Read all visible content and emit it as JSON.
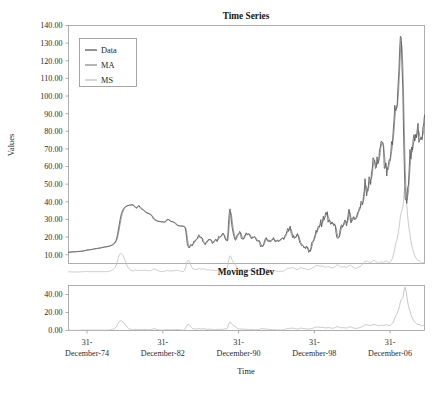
{
  "figure": {
    "axis_label_x": "Time",
    "axis_label_y": "Values"
  },
  "panels": {
    "top": {
      "title": "Time Series",
      "yticks": [
        "10.00",
        "20.00",
        "30.00",
        "40.00",
        "50.00",
        "60.00",
        "70.00",
        "80.00",
        "90.00",
        "100.00",
        "110.00",
        "120.00",
        "130.00",
        "140.00"
      ],
      "legend": [
        {
          "label": "Data",
          "color": "#585858"
        },
        {
          "label": "MA",
          "color": "#8c8c8c"
        },
        {
          "label": "MS",
          "color": "#c2c2c2"
        }
      ]
    },
    "bottom": {
      "title": "Moving StDev",
      "yticks": [
        "0.00",
        "20.00",
        "40.00"
      ]
    },
    "xticks": [
      "31-\nDecember-74",
      "31-\nDecember-82",
      "31-\nDecember-90",
      "31-\nDecember-98",
      "31-\nDecember-06"
    ],
    "xticks_line1": [
      "31-",
      "31-",
      "31-",
      "31-",
      "31-"
    ],
    "xticks_line2": [
      "December-74",
      "December-82",
      "December-90",
      "December-98",
      "December-06"
    ]
  },
  "chart_data": {
    "type": "line",
    "title": "Time Series",
    "xlabel": "Time",
    "ylabel": "Values",
    "grid": false,
    "legend_position": "top-left",
    "subplots": [
      {
        "name": "Time Series",
        "ylim": [
          5,
          140
        ],
        "yticks": [
          10,
          20,
          30,
          40,
          50,
          60,
          70,
          80,
          90,
          100,
          110,
          120,
          130,
          140
        ],
        "series": [
          {
            "name": "Data",
            "color": "#585858"
          },
          {
            "name": "MA",
            "color": "#8c8c8c"
          },
          {
            "name": "MS",
            "color": "#c2c2c2"
          }
        ]
      },
      {
        "name": "Moving StDev",
        "ylim": [
          0,
          50
        ],
        "yticks": [
          0,
          20,
          40
        ],
        "series": [
          {
            "name": "MS",
            "color": "#bdbdbd"
          }
        ]
      }
    ],
    "x_tick_labels": [
      "31-December-74",
      "31-December-82",
      "31-December-90",
      "31-December-98",
      "31-December-06"
    ],
    "x_tick_values": [
      1974.96,
      1982.96,
      1990.96,
      1998.96,
      2006.96
    ],
    "x_range": [
      1973.0,
      2010.6
    ],
    "x_step_years": 0.0833,
    "values_data": [
      11.4,
      11.4,
      11.5,
      11.5,
      11.6,
      11.6,
      11.6,
      11.6,
      11.7,
      11.7,
      11.7,
      11.8,
      11.8,
      11.8,
      11.9,
      11.9,
      12.0,
      12.0,
      12.1,
      12.2,
      12.3,
      12.4,
      12.5,
      12.6,
      12.7,
      12.7,
      12.8,
      12.9,
      12.9,
      13.0,
      13.1,
      13.2,
      13.3,
      13.4,
      13.4,
      13.5,
      13.6,
      13.6,
      13.7,
      13.8,
      13.9,
      14.0,
      14.1,
      14.2,
      14.3,
      14.4,
      14.4,
      14.5,
      14.6,
      14.7,
      14.8,
      14.9,
      15.1,
      15.3,
      15.5,
      15.8,
      16.1,
      16.6,
      17.2,
      18.0,
      19.4,
      21.5,
      24.0,
      26.8,
      29.5,
      31.8,
      33.5,
      34.8,
      35.7,
      36.4,
      36.9,
      37.3,
      37.6,
      37.8,
      37.9,
      38.0,
      38.1,
      38.2,
      38.3,
      38.3,
      38.2,
      37.9,
      37.4,
      36.8,
      36.3,
      36.6,
      37.4,
      37.9,
      37.6,
      36.8,
      36.2,
      35.9,
      35.7,
      35.4,
      34.9,
      34.4,
      34.0,
      33.8,
      33.6,
      33.4,
      33.2,
      33.0,
      32.7,
      32.3,
      31.8,
      30.9,
      30.2,
      29.8,
      29.6,
      29.4,
      29.2,
      29.0,
      28.9,
      28.8,
      28.8,
      28.7,
      28.6,
      28.6,
      28.5,
      28.4,
      28.6,
      29.0,
      29.6,
      30.1,
      30.0,
      29.7,
      29.2,
      28.9,
      28.8,
      28.7,
      28.6,
      28.3,
      28.0,
      27.6,
      27.2,
      26.8,
      26.5,
      26.4,
      26.4,
      26.3,
      26.2,
      26.2,
      26.2,
      26.1,
      25.9,
      25.3,
      23.4,
      19.1,
      15.4,
      14.5,
      13.8,
      14.7,
      15.8,
      15.5,
      15.1,
      16.3,
      17.7,
      17.5,
      18.3,
      18.6,
      19.2,
      20.2,
      21.3,
      20.3,
      19.5,
      19.9,
      19.5,
      17.6,
      16.9,
      16.4,
      15.6,
      16.8,
      17.6,
      17.6,
      18.6,
      18.7,
      18.4,
      18.5,
      17.7,
      16.3,
      17.1,
      17.4,
      18.2,
      18.8,
      18.3,
      17.4,
      19.1,
      20.4,
      19.9,
      20.1,
      20.7,
      21.6,
      22.3,
      21.5,
      20.4,
      18.9,
      18.2,
      17.7,
      18.2,
      27.3,
      33.5,
      36.0,
      32.3,
      27.3,
      24.5,
      22.0,
      20.4,
      18.6,
      18.2,
      19.9,
      21.4,
      21.7,
      21.9,
      23.2,
      22.5,
      19.5,
      18.8,
      19.0,
      18.9,
      20.8,
      20.9,
      22.4,
      21.7,
      21.3,
      21.9,
      21.7,
      20.3,
      19.4,
      19.1,
      20.1,
      19.8,
      20.3,
      19.9,
      19.1,
      17.9,
      18.0,
      17.5,
      18.1,
      16.9,
      14.4,
      15.0,
      14.8,
      14.7,
      16.4,
      17.9,
      19.1,
      19.7,
      18.4,
      17.5,
      17.7,
      18.1,
      17.2,
      18.1,
      18.6,
      18.5,
      19.7,
      18.4,
      17.4,
      17.3,
      18.0,
      18.4,
      17.4,
      17.8,
      18.2,
      18.9,
      19.1,
      19.4,
      19.5,
      18.6,
      20.4,
      21.3,
      22.0,
      23.8,
      24.9,
      23.2,
      25.2,
      26.2,
      22.2,
      21.3,
      19.6,
      20.9,
      19.2,
      19.7,
      19.9,
      21.3,
      22.0,
      20.2,
      18.3,
      16.7,
      16.1,
      15.1,
      15.4,
      15.0,
      13.8,
      14.1,
      13.4,
      14.9,
      14.4,
      13.0,
      11.3,
      12.5,
      12.0,
      14.7,
      17.3,
      17.7,
      17.9,
      20.1,
      21.3,
      23.8,
      22.7,
      25.0,
      26.1,
      25.6,
      27.3,
      29.9,
      25.7,
      28.8,
      31.8,
      29.8,
      31.2,
      33.9,
      33.0,
      34.4,
      28.4,
      29.6,
      29.6,
      27.3,
      27.4,
      28.6,
      27.6,
      26.5,
      27.5,
      26.2,
      22.2,
      19.6,
      19.4,
      19.7,
      20.7,
      24.0,
      26.3,
      27.0,
      25.5,
      26.9,
      28.4,
      29.7,
      28.8,
      26.3,
      29.4,
      32.9,
      35.8,
      33.5,
      28.2,
      28.2,
      30.7,
      30.8,
      31.6,
      29.7,
      30.3,
      31.1,
      32.5,
      34.3,
      34.7,
      36.7,
      36.7,
      40.3,
      39.8,
      38.3,
      43.0,
      45.9,
      53.1,
      48.5,
      43.3,
      46.8,
      48.2,
      54.2,
      53.0,
      49.8,
      56.4,
      59.0,
      65.0,
      64.0,
      62.4,
      58.9,
      59.4,
      65.5,
      61.6,
      62.9,
      69.7,
      70.9,
      74.4,
      74.1,
      73.0,
      70.8,
      58.9,
      59.3,
      62.0,
      54.6,
      59.3,
      60.6,
      63.9,
      63.5,
      67.5,
      74.2,
      72.4,
      79.9,
      85.8,
      94.8,
      91.7,
      92.9,
      95.4,
      105.5,
      112.6,
      125.4,
      133.9,
      133.4,
      116.7,
      104.1,
      76.6,
      57.4,
      41.4,
      41.7,
      39.1,
      48.0,
      49.6,
      59.2,
      69.7,
      64.2,
      71.1,
      69.4,
      75.8,
      78.1,
      74.5,
      78.3,
      76.4,
      81.2,
      84.5,
      73.7,
      75.3,
      76.3,
      76.6,
      75.2,
      81.9,
      84.1,
      89.2
    ],
    "values_ms": [
      0.3,
      0.3,
      0.3,
      0.3,
      0.2,
      0.2,
      0.2,
      0.2,
      0.2,
      0.2,
      0.2,
      0.2,
      0.2,
      0.2,
      0.3,
      0.3,
      0.3,
      0.3,
      0.4,
      0.4,
      0.4,
      0.4,
      0.4,
      0.5,
      0.5,
      0.4,
      0.4,
      0.4,
      0.4,
      0.4,
      0.4,
      0.4,
      0.4,
      0.4,
      0.4,
      0.4,
      0.4,
      0.4,
      0.4,
      0.4,
      0.4,
      0.4,
      0.4,
      0.4,
      0.4,
      0.4,
      0.4,
      0.4,
      0.4,
      0.4,
      0.5,
      0.5,
      0.7,
      0.9,
      1.1,
      1.4,
      1.8,
      2.2,
      2.8,
      3.6,
      4.8,
      6.5,
      8.3,
      9.5,
      10.4,
      10.8,
      10.6,
      10.1,
      9.4,
      8.4,
      7.2,
      6.0,
      4.8,
      3.8,
      2.9,
      2.2,
      1.7,
      1.3,
      1.1,
      0.9,
      0.8,
      0.9,
      1.1,
      1.3,
      1.3,
      1.1,
      1.0,
      1.0,
      1.0,
      1.2,
      1.2,
      1.1,
      1.0,
      1.1,
      1.2,
      1.2,
      1.2,
      1.1,
      1.0,
      0.9,
      0.9,
      0.9,
      1.0,
      1.1,
      1.3,
      1.7,
      1.9,
      1.9,
      1.7,
      1.4,
      1.2,
      1.0,
      0.8,
      0.7,
      0.6,
      0.5,
      0.5,
      0.5,
      0.5,
      0.6,
      0.7,
      0.9,
      1.0,
      1.0,
      0.9,
      0.8,
      0.8,
      0.8,
      0.8,
      0.8,
      0.8,
      0.9,
      1.0,
      1.0,
      1.1,
      1.1,
      1.1,
      1.0,
      0.9,
      0.7,
      0.6,
      0.5,
      0.4,
      0.4,
      0.8,
      1.8,
      3.3,
      5.2,
      6.5,
      6.8,
      6.6,
      5.7,
      4.3,
      3.3,
      2.4,
      1.8,
      1.8,
      1.7,
      1.7,
      1.6,
      1.7,
      1.9,
      2.1,
      2.2,
      2.0,
      1.7,
      1.6,
      1.9,
      2.0,
      1.9,
      1.8,
      1.5,
      1.3,
      1.3,
      1.5,
      1.5,
      1.3,
      1.2,
      1.1,
      1.3,
      1.2,
      1.0,
      1.0,
      1.0,
      1.1,
      1.2,
      1.4,
      1.4,
      1.2,
      1.1,
      1.2,
      1.4,
      1.5,
      1.4,
      1.5,
      1.8,
      1.8,
      1.9,
      3.4,
      6.2,
      8.2,
      9.4,
      9.0,
      7.6,
      6.5,
      5.8,
      5.4,
      5.0,
      4.2,
      3.2,
      2.3,
      1.8,
      1.7,
      1.7,
      1.6,
      1.7,
      1.8,
      1.6,
      1.4,
      1.3,
      1.3,
      1.4,
      1.3,
      1.2,
      1.0,
      1.0,
      1.1,
      1.2,
      1.1,
      1.0,
      0.9,
      0.8,
      0.8,
      0.9,
      1.0,
      1.0,
      1.0,
      1.1,
      1.4,
      1.8,
      2.0,
      2.0,
      1.9,
      1.7,
      1.6,
      1.7,
      1.8,
      1.6,
      1.4,
      1.2,
      1.1,
      1.1,
      1.0,
      0.9,
      0.8,
      0.9,
      0.9,
      0.9,
      0.8,
      0.7,
      0.6,
      0.6,
      0.6,
      0.6,
      0.6,
      0.6,
      0.6,
      0.7,
      0.8,
      1.1,
      1.5,
      1.8,
      2.2,
      2.4,
      2.3,
      2.3,
      2.4,
      2.5,
      2.5,
      2.6,
      2.5,
      2.3,
      2.1,
      1.8,
      1.6,
      1.6,
      1.8,
      2.1,
      2.5,
      2.6,
      2.6,
      2.4,
      2.2,
      2.2,
      2.1,
      1.9,
      1.7,
      1.5,
      1.5,
      1.7,
      1.9,
      1.9,
      2.0,
      2.3,
      2.6,
      2.8,
      3.2,
      3.5,
      3.8,
      3.8,
      3.9,
      3.8,
      3.6,
      3.4,
      3.5,
      3.6,
      3.5,
      3.4,
      3.2,
      3.0,
      2.9,
      3.0,
      3.1,
      3.3,
      3.2,
      3.0,
      2.8,
      2.7,
      2.6,
      2.5,
      2.6,
      2.9,
      3.3,
      3.8,
      4.2,
      4.2,
      4.0,
      3.6,
      3.2,
      3.0,
      3.0,
      3.1,
      3.2,
      3.1,
      3.0,
      2.8,
      2.7,
      2.9,
      3.4,
      3.8,
      4.0,
      4.0,
      3.7,
      3.3,
      2.9,
      2.6,
      2.4,
      2.3,
      2.3,
      2.5,
      2.7,
      2.9,
      3.1,
      3.3,
      3.7,
      4.1,
      4.5,
      5.0,
      5.6,
      6.3,
      6.5,
      6.4,
      6.2,
      5.9,
      5.9,
      5.8,
      5.6,
      5.8,
      6.2,
      6.6,
      6.8,
      6.6,
      6.2,
      5.9,
      5.8,
      5.5,
      5.2,
      5.4,
      5.6,
      5.9,
      6.0,
      5.8,
      5.6,
      6.0,
      6.2,
      6.1,
      6.4,
      6.0,
      5.6,
      5.4,
      5.6,
      6.2,
      7.0,
      7.8,
      9.2,
      11.0,
      13.5,
      15.8,
      17.6,
      19.0,
      21.4,
      24.2,
      27.8,
      31.5,
      34.0,
      35.5,
      36.4,
      41.5,
      46.5,
      48.2,
      44.0,
      38.0,
      32.0,
      27.5,
      24.0,
      21.5,
      18.0,
      15.5,
      13.8,
      12.0,
      10.5,
      9.4,
      8.5,
      7.6,
      7.0,
      6.6,
      6.8,
      6.5,
      6.0,
      5.5,
      5.2,
      5.4,
      5.6,
      6.2
    ]
  }
}
